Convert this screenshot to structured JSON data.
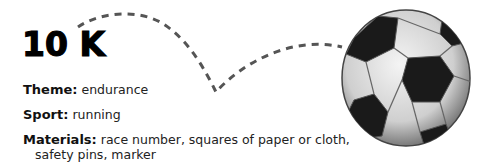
{
  "title": "10 K",
  "fields": [
    {
      "label": "Theme:",
      "value": "endurance"
    },
    {
      "label": "Sport:",
      "value": "running"
    },
    {
      "label": "Materials:",
      "value": "race number, squares of paper or cloth,",
      "continuation": "safety pins, marker"
    }
  ],
  "illustration": {
    "icon": "soccer-ball-icon",
    "path": "dashed-bounce-path-icon"
  }
}
